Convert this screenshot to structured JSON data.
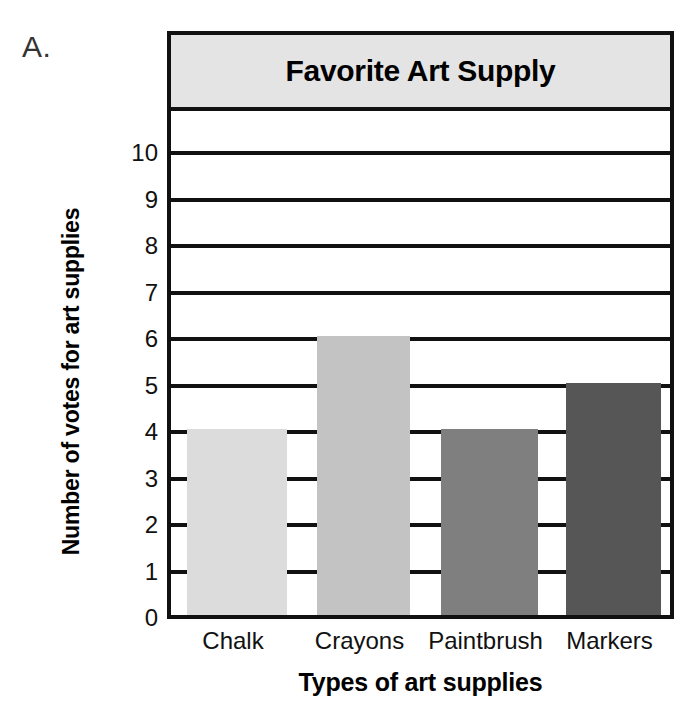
{
  "figure": {
    "panel_label": "A."
  },
  "chart_data": {
    "type": "bar",
    "title": "Favorite Art Supply",
    "xlabel": "Types of art supplies",
    "ylabel": "Number of votes for art supplies",
    "categories": [
      "Chalk",
      "Crayons",
      "Paintbrush",
      "Markers"
    ],
    "values": [
      4,
      6,
      4,
      5
    ],
    "ylim": [
      0,
      11
    ],
    "yticks": [
      0,
      1,
      2,
      3,
      4,
      5,
      6,
      7,
      8,
      9,
      10
    ],
    "ytick_labels": [
      "0",
      "1",
      "2",
      "3",
      "4",
      "5",
      "6",
      "7",
      "8",
      "9",
      "10"
    ],
    "grid": true,
    "legend": "none",
    "bar_colors": [
      "#dcdcdc",
      "#c3c3c3",
      "#7f7f7f",
      "#565656"
    ],
    "title_band_color": "#e4e4e4",
    "axis_color": "#111111",
    "plot_background": "#ffffff"
  }
}
